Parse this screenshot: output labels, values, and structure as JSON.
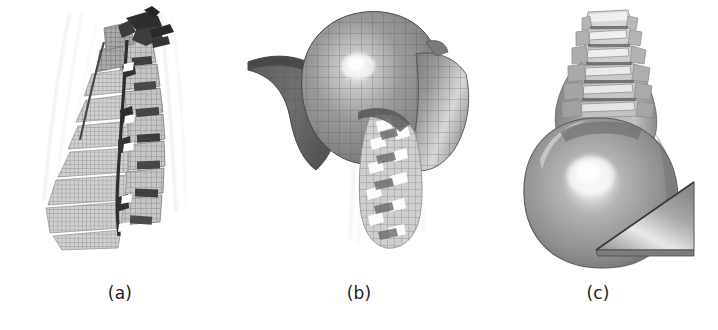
{
  "figure": {
    "width": 718,
    "height": 330,
    "background_color": "#ffffff",
    "type": "scientific-figure-three-panel"
  },
  "panels": [
    {
      "id": "a",
      "caption": "(a)",
      "subject": "cervical-spine-mesh-lateral-view",
      "content_description": "Lateral view of meshed cervical vertebrae column with dark posterior elements and intervertebral discs, faint ligament lines in background",
      "colors": {
        "mesh_light": "#c9c9c9",
        "mesh_mid": "#a8a8a8",
        "mesh_dark": "#3a3a3a",
        "grid_line": "#7c7c7c",
        "ligament_line": "#d8d8d8"
      }
    },
    {
      "id": "b",
      "caption": "(b)",
      "subject": "skull-shell-and-spine-mesh-oblique-view",
      "content_description": "Oblique view of meshed cranial shell segments (dark left arc, bright central dome with specular highlight, right lateral flap) with cervical spine column emerging below",
      "colors": {
        "arc_dark": "#6a6a6a",
        "dome_mid": "#8c8c8c",
        "dome_highlight": "#f0f0f0",
        "flap_mid": "#8f8f8f",
        "spine_light": "#d4d4d4",
        "grid_line": "#5e5e5e"
      }
    },
    {
      "id": "c",
      "caption": "(c)",
      "subject": "head-and-cervical-spine-posterior-view",
      "content_description": "Posterior view of smooth-shaded head/skull volume with cervical vertebrae column above and an inclined wedge plane at lower right",
      "colors": {
        "head_mid": "#989898",
        "head_highlight": "#f2f2f2",
        "head_shadow": "#6e6e6e",
        "spine_light": "#cfcfcf",
        "wedge_mid": "#9b9b9b",
        "wedge_highlight": "#e8e8e8",
        "outline": "#555555"
      }
    }
  ]
}
